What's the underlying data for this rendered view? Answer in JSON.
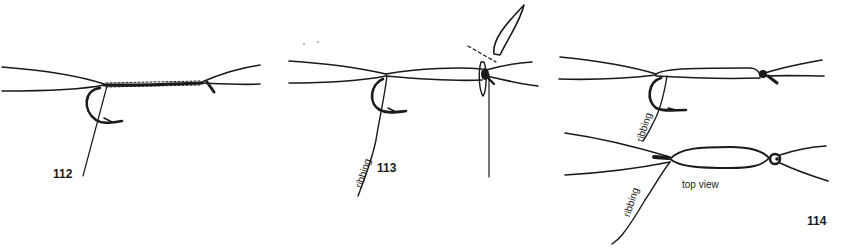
{
  "figures": [
    {
      "id": "fig-112",
      "number": "112",
      "labels": []
    },
    {
      "id": "fig-113",
      "number": "113",
      "labels": [
        {
          "text": "ribbing"
        }
      ]
    },
    {
      "id": "fig-114",
      "number": "114",
      "labels": [
        {
          "text": "ribbing"
        },
        {
          "text": "ribbing"
        },
        {
          "text": "top view"
        }
      ]
    }
  ],
  "colors": {
    "ink": "#1a1a1a",
    "background": "#ffffff"
  }
}
